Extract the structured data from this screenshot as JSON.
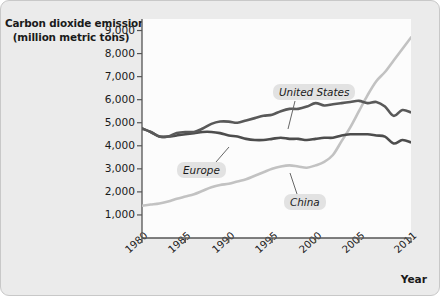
{
  "figure": {
    "title_line1": "Carbon dioxide emissions",
    "title_line2": "(million metric tons)",
    "xaxis_name": "Year",
    "background_color": "#ebebeb",
    "plot_background_color": "#fcfcfc"
  },
  "labels": {
    "united_states": "United States",
    "europe": "Europe",
    "china": "China"
  },
  "chart_data": {
    "type": "line",
    "title": "Carbon dioxide emissions (million metric tons)",
    "xlabel": "Year",
    "ylabel": "Carbon dioxide emissions (million metric tons)",
    "xlim": [
      1980,
      2011
    ],
    "ylim": [
      0,
      9500
    ],
    "ytick_labels": [
      "9,000",
      "8,000",
      "7,000",
      "6,000",
      "5,000",
      "4,000",
      "3,000",
      "2,000",
      "1,000"
    ],
    "ytick_values": [
      9000,
      8000,
      7000,
      6000,
      5000,
      4000,
      3000,
      2000,
      1000
    ],
    "xtick_labels": [
      "1980",
      "1985",
      "1990",
      "1995",
      "2000",
      "2005",
      "2011"
    ],
    "xtick_values": [
      1980,
      1985,
      1990,
      1995,
      2000,
      2005,
      2011
    ],
    "grid": false,
    "legend": "inline-callout-labels",
    "x": [
      1980,
      1981,
      1982,
      1983,
      1984,
      1985,
      1986,
      1987,
      1988,
      1989,
      1990,
      1991,
      1992,
      1993,
      1994,
      1995,
      1996,
      1997,
      1998,
      1999,
      2000,
      2001,
      2002,
      2003,
      2004,
      2005,
      2006,
      2007,
      2008,
      2009,
      2010,
      2011
    ],
    "series": [
      {
        "name": "United States",
        "color": "#595959",
        "values": [
          4750,
          4600,
          4400,
          4400,
          4550,
          4600,
          4600,
          4750,
          4950,
          5050,
          5050,
          5000,
          5100,
          5200,
          5300,
          5350,
          5500,
          5600,
          5600,
          5700,
          5850,
          5750,
          5800,
          5850,
          5900,
          5950,
          5850,
          5900,
          5700,
          5300,
          5550,
          5450
        ]
      },
      {
        "name": "Europe",
        "color": "#4d4d4d",
        "values": [
          4750,
          4600,
          4400,
          4400,
          4450,
          4500,
          4550,
          4600,
          4600,
          4550,
          4450,
          4400,
          4300,
          4250,
          4250,
          4300,
          4350,
          4300,
          4300,
          4250,
          4300,
          4350,
          4350,
          4450,
          4500,
          4500,
          4500,
          4450,
          4400,
          4100,
          4250,
          4150
        ]
      },
      {
        "name": "China",
        "color": "#c2c2c2",
        "values": [
          1400,
          1450,
          1500,
          1580,
          1700,
          1800,
          1900,
          2050,
          2200,
          2300,
          2350,
          2450,
          2550,
          2700,
          2850,
          3000,
          3100,
          3150,
          3100,
          3050,
          3150,
          3300,
          3600,
          4200,
          4800,
          5500,
          6200,
          6800,
          7200,
          7700,
          8200,
          8700
        ]
      }
    ]
  }
}
